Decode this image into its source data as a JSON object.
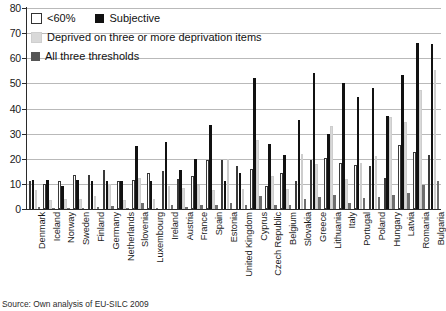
{
  "chart_data": {
    "type": "bar",
    "title": "",
    "xlabel": "",
    "ylabel": "",
    "ylim": [
      0,
      80
    ],
    "yticks": [
      0,
      10,
      20,
      30,
      40,
      50,
      60,
      70,
      80
    ],
    "grid": true,
    "legend_position": "top-left",
    "source": "Source: Own analysis of EU-SILC 2009",
    "categories": [
      "Denmark",
      "Iceland",
      "Norway",
      "Sweden",
      "Finland",
      "Germany",
      "Netherlands",
      "Slovenia",
      "Luxembourg",
      "Ireland",
      "Austria",
      "France",
      "Spain",
      "Estonia",
      "United Kingdom",
      "Cyprus",
      "Czech Republic",
      "Belgium",
      "Slovakia",
      "Greece",
      "Lithuania",
      "Italy",
      "Portugal",
      "Poland",
      "Hungary",
      "Latvia",
      "Romania",
      "Bulgaria"
    ],
    "series": [
      {
        "name": "<60%",
        "key": "lt60",
        "color": "#ffffff",
        "values": [
          11.0,
          10.0,
          11.0,
          13.5,
          13.5,
          15.5,
          11.0,
          11.5,
          14.5,
          15.0,
          12.0,
          13.0,
          19.5,
          19.5,
          17.0,
          16.0,
          9.0,
          14.5,
          11.0,
          19.5,
          20.5,
          18.5,
          17.5,
          17.0,
          12.5,
          25.5,
          22.5,
          21.5
        ]
      },
      {
        "name": "Subjective",
        "key": "subjective",
        "color": "#111111",
        "values": [
          11.5,
          11.5,
          9.0,
          11.5,
          11.0,
          11.0,
          11.0,
          25.0,
          11.0,
          26.5,
          15.5,
          20.0,
          33.5,
          11.0,
          14.5,
          52.0,
          26.0,
          21.5,
          35.5,
          54.0,
          30.0,
          50.0,
          44.5,
          48.0,
          37.0,
          53.5,
          66.0,
          65.5
        ]
      },
      {
        "name": "Deprived on three or more deprivation items",
        "key": "deprived3plus",
        "color": "#d9d9d9",
        "values": [
          7.5,
          3.5,
          4.0,
          4.0,
          5.0,
          10.0,
          3.5,
          12.5,
          4.0,
          9.0,
          8.5,
          9.5,
          7.5,
          20.0,
          8.0,
          27.5,
          13.0,
          8.0,
          22.0,
          18.0,
          33.0,
          12.0,
          18.5,
          21.0,
          36.5,
          34.5,
          47.5,
          55.5
        ]
      },
      {
        "name": "All three thresholds",
        "key": "all_three",
        "color": "#6e6e6e",
        "values": [
          0.8,
          0.5,
          0.4,
          0.5,
          0.7,
          1.2,
          0.4,
          2.2,
          0.6,
          1.6,
          1.0,
          1.5,
          1.5,
          2.5,
          1.4,
          5.0,
          1.6,
          1.4,
          4.0,
          4.8,
          5.6,
          2.2,
          4.5,
          4.8,
          5.6,
          6.5,
          9.5,
          11.0
        ]
      }
    ]
  },
  "legend": {
    "rows": [
      [
        {
          "label": "<60%",
          "swatch": "lt60"
        },
        {
          "label": "Subjective",
          "swatch": "subjective"
        }
      ],
      [
        {
          "label": "Deprived on three or more deprivation items",
          "swatch": "deprived3plus"
        }
      ],
      [
        {
          "label": "All three thresholds",
          "swatch": "all_three"
        }
      ]
    ]
  }
}
